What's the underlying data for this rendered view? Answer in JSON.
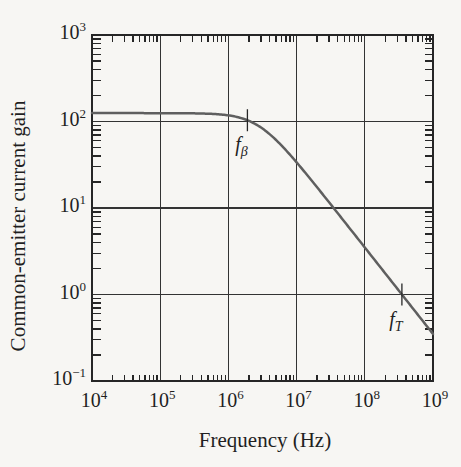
{
  "figure": {
    "background": "#f7f6f3",
    "ink_color": "#262626",
    "grid_color": "#333333",
    "curve_color": "#5f5f5f"
  },
  "chart_data": {
    "type": "line",
    "title": "",
    "xlabel": "Frequency (Hz)",
    "ylabel": "Common-emitter current gain",
    "x_scale": "log",
    "y_scale": "log",
    "xlim": [
      10000,
      1000000000
    ],
    "ylim": [
      0.1,
      1000
    ],
    "grid": true,
    "legend": false,
    "x_ticks": [
      {
        "base": "10",
        "exp": "4",
        "value": 10000
      },
      {
        "base": "10",
        "exp": "5",
        "value": 100000
      },
      {
        "base": "10",
        "exp": "6",
        "value": 1000000
      },
      {
        "base": "10",
        "exp": "7",
        "value": 10000000
      },
      {
        "base": "10",
        "exp": "8",
        "value": 100000000
      },
      {
        "base": "10",
        "exp": "9",
        "value": 1000000000
      }
    ],
    "y_ticks": [
      {
        "base": "10",
        "exp": "3",
        "value": 1000
      },
      {
        "base": "10",
        "exp": "2",
        "value": 100
      },
      {
        "base": "10",
        "exp": "1",
        "value": 10
      },
      {
        "base": "10",
        "exp": "0",
        "value": 1
      },
      {
        "base": "10",
        "exp": "−1",
        "value": 0.1
      }
    ],
    "series": [
      {
        "name": "common-emitter current gain magnitude",
        "model": {
          "type": "single-pole-low-pass",
          "beta0": 125,
          "f_beta_hz": 2800000
        },
        "points": [
          {
            "f_hz": 10000,
            "gain": 125.0
          },
          {
            "f_hz": 50000,
            "gain": 125.0
          },
          {
            "f_hz": 100000,
            "gain": 125.0
          },
          {
            "f_hz": 200000,
            "gain": 124.7
          },
          {
            "f_hz": 500000,
            "gain": 123.1
          },
          {
            "f_hz": 1000000,
            "gain": 117.7
          },
          {
            "f_hz": 2000000,
            "gain": 101.7
          },
          {
            "f_hz": 3000000,
            "gain": 85.3
          },
          {
            "f_hz": 5000000,
            "gain": 61.1
          },
          {
            "f_hz": 10000000,
            "gain": 33.7
          },
          {
            "f_hz": 20000000,
            "gain": 17.3
          },
          {
            "f_hz": 50000000,
            "gain": 7.0
          },
          {
            "f_hz": 100000000,
            "gain": 3.5
          },
          {
            "f_hz": 200000000,
            "gain": 1.75
          },
          {
            "f_hz": 350000000,
            "gain": 1.0
          },
          {
            "f_hz": 500000000,
            "gain": 0.7
          },
          {
            "f_hz": 1000000000,
            "gain": 0.35
          }
        ]
      }
    ],
    "annotations": [
      {
        "id": "f-beta",
        "label_main": "f",
        "label_sub": "β",
        "f_hz": 1900000,
        "gain_at_marker": 103.4,
        "marker": "vertical-tick"
      },
      {
        "id": "f-T",
        "label_main": "f",
        "label_sub": "T",
        "f_hz": 350000000,
        "gain_at_marker": 1.0,
        "marker": "vertical-tick"
      }
    ]
  }
}
